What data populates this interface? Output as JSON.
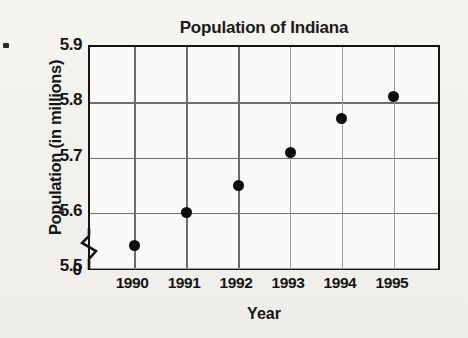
{
  "chart_data": {
    "type": "scatter",
    "title": "Population of Indiana",
    "xlabel": "Year",
    "ylabel": "Population (in millions)",
    "categories": [
      "1990",
      "1991",
      "1992",
      "1993",
      "1994",
      "1995"
    ],
    "x": [
      1990,
      1991,
      1992,
      1993,
      1994,
      1995
    ],
    "values": [
      5.54,
      5.6,
      5.65,
      5.71,
      5.77,
      5.81
    ],
    "series": [
      {
        "name": "Population of Indiana",
        "values": [
          5.54,
          5.6,
          5.65,
          5.71,
          5.77,
          5.81
        ]
      }
    ],
    "ylim": [
      5.5,
      5.9
    ],
    "yticks": [
      "5.5",
      "5.6",
      "5.7",
      "5.8",
      "5.9"
    ],
    "y_axis_origin_label": "0",
    "y_axis_break": true,
    "xlim": [
      1989.5,
      1995.5
    ],
    "grid": true,
    "legend": false,
    "marker": "filled-circle",
    "marker_color": "#0d0d0d"
  },
  "axis": {
    "y_ticks": [
      {
        "label": "5.9",
        "value": 5.9
      },
      {
        "label": "5.8",
        "value": 5.8
      },
      {
        "label": "5.7",
        "value": 5.7
      },
      {
        "label": "5.6",
        "value": 5.6
      },
      {
        "label": "5.5",
        "value": 5.5
      }
    ],
    "zero_label": "0",
    "x_ticks": [
      "1990",
      "1991",
      "1992",
      "1993",
      "1994",
      "1995"
    ]
  },
  "colors": {
    "background": "#f3f2ef",
    "axis": "#141414",
    "grid": "#6d6d6d",
    "marker": "#0d0d0d"
  }
}
